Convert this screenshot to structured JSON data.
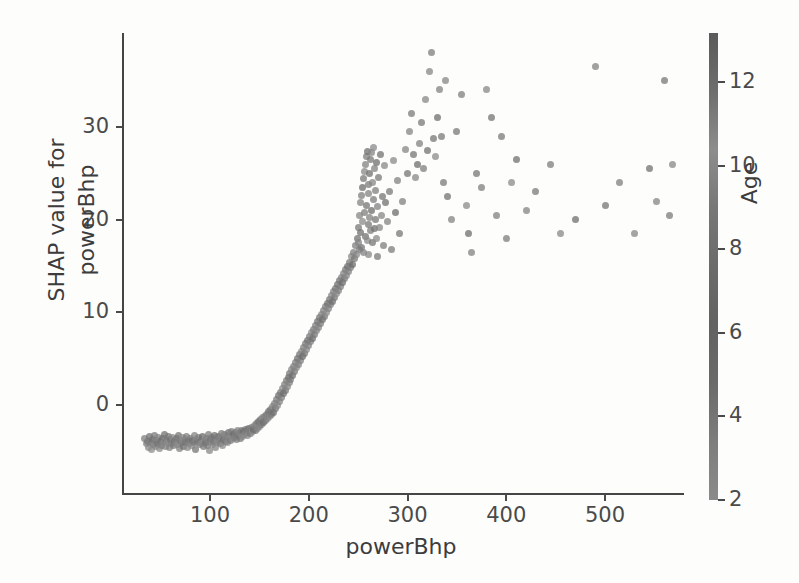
{
  "figure": {
    "kind": "shap-dependence-plot",
    "background": "#fdfdfc",
    "axis_color": "#454545",
    "text_color": "#3c3c3c"
  },
  "axes": {
    "xlabel": "powerBhp",
    "ylabel_line1": "SHAP value for",
    "ylabel_line2": "powerBhp",
    "xticks": [
      "100",
      "200",
      "300",
      "400",
      "500"
    ],
    "yticks": [
      "0",
      "10",
      "20",
      "30"
    ]
  },
  "colorbar": {
    "label": "Age",
    "ticks": [
      "2",
      "4",
      "6",
      "8",
      "10",
      "12"
    ],
    "low_color": "#8a8a8a",
    "high_color": "#5a5a5a"
  },
  "chart_data": {
    "type": "scatter",
    "title": "",
    "xlabel": "powerBhp",
    "ylabel": "SHAP value for powerBhp",
    "color_label": "Age",
    "xlim": [
      20,
      580
    ],
    "ylim": [
      -6,
      39
    ],
    "clim": [
      2,
      13
    ],
    "xticks": [
      100,
      200,
      300,
      400,
      500
    ],
    "yticks": [
      0,
      10,
      20,
      30
    ],
    "cticks": [
      2,
      4,
      6,
      8,
      10,
      12
    ],
    "grid": false,
    "legend": "colorbar-right",
    "marker_size_px": 7,
    "marker_opacity": 0.75,
    "colormap": "grayscale",
    "points": [
      [
        34,
        -3.6,
        6.2
      ],
      [
        36,
        -4.2,
        5.1
      ],
      [
        37,
        -3.9,
        7.4
      ],
      [
        38,
        -4.6,
        4.3
      ],
      [
        39,
        -3.4,
        8.8
      ],
      [
        40,
        -4.1,
        6.0
      ],
      [
        41,
        -4.8,
        3.6
      ],
      [
        42,
        -3.7,
        9.2
      ],
      [
        43,
        -4.3,
        5.5
      ],
      [
        44,
        -3.3,
        7.1
      ],
      [
        45,
        -4.5,
        4.8
      ],
      [
        46,
        -3.8,
        6.6
      ],
      [
        47,
        -4.2,
        8.1
      ],
      [
        48,
        -3.5,
        5.2
      ],
      [
        49,
        -4.7,
        3.9
      ],
      [
        50,
        -3.9,
        7.8
      ],
      [
        51,
        -4.4,
        6.3
      ],
      [
        52,
        -3.6,
        9.0
      ],
      [
        53,
        -4.0,
        4.6
      ],
      [
        54,
        -3.2,
        8.3
      ],
      [
        55,
        -4.5,
        5.7
      ],
      [
        56,
        -3.8,
        6.9
      ],
      [
        57,
        -4.1,
        4.1
      ],
      [
        58,
        -3.4,
        7.6
      ],
      [
        59,
        -4.6,
        5.9
      ],
      [
        60,
        -3.7,
        8.5
      ],
      [
        61,
        -4.2,
        6.1
      ],
      [
        62,
        -3.5,
        4.4
      ],
      [
        63,
        -4.4,
        7.2
      ],
      [
        64,
        -3.9,
        9.4
      ],
      [
        65,
        -4.0,
        5.3
      ],
      [
        66,
        -3.6,
        6.8
      ],
      [
        67,
        -4.3,
        4.0
      ],
      [
        68,
        -3.3,
        8.0
      ],
      [
        69,
        -4.7,
        5.6
      ],
      [
        70,
        -3.8,
        7.3
      ],
      [
        71,
        -4.1,
        6.5
      ],
      [
        72,
        -3.5,
        3.8
      ],
      [
        73,
        -4.5,
        9.1
      ],
      [
        74,
        -3.7,
        5.0
      ],
      [
        75,
        -4.0,
        7.7
      ],
      [
        76,
        -3.4,
        6.2
      ],
      [
        77,
        -4.6,
        4.5
      ],
      [
        78,
        -3.9,
        8.6
      ],
      [
        79,
        -4.2,
        5.8
      ],
      [
        80,
        -3.6,
        7.0
      ],
      [
        81,
        -4.4,
        3.5
      ],
      [
        82,
        -3.8,
        9.3
      ],
      [
        83,
        -4.1,
        6.4
      ],
      [
        84,
        -3.3,
        5.4
      ],
      [
        85,
        -4.8,
        7.9
      ],
      [
        86,
        -3.7,
        4.9
      ],
      [
        87,
        -4.0,
        8.2
      ],
      [
        88,
        -3.5,
        6.0
      ],
      [
        89,
        -4.3,
        5.1
      ],
      [
        90,
        -3.9,
        7.5
      ],
      [
        91,
        -4.2,
        3.7
      ],
      [
        92,
        -3.4,
        9.6
      ],
      [
        93,
        -4.5,
        6.7
      ],
      [
        94,
        -3.8,
        4.2
      ],
      [
        95,
        -4.0,
        8.4
      ],
      [
        96,
        -3.6,
        5.5
      ],
      [
        97,
        -4.4,
        7.1
      ],
      [
        98,
        -3.2,
        6.3
      ],
      [
        99,
        -4.9,
        4.7
      ],
      [
        100,
        -3.7,
        8.9
      ],
      [
        101,
        -4.1,
        5.9
      ],
      [
        102,
        -3.5,
        6.6
      ],
      [
        103,
        -4.3,
        3.4
      ],
      [
        104,
        -3.9,
        7.4
      ],
      [
        105,
        -3.3,
        9.0
      ],
      [
        106,
        -4.6,
        5.2
      ],
      [
        107,
        -3.8,
        6.1
      ],
      [
        108,
        -4.0,
        4.4
      ],
      [
        109,
        -3.4,
        8.7
      ],
      [
        110,
        -3.6,
        5.8
      ],
      [
        111,
        -4.2,
        7.2
      ],
      [
        112,
        -3.1,
        6.5
      ],
      [
        113,
        -4.4,
        4.0
      ],
      [
        114,
        -3.7,
        9.2
      ],
      [
        115,
        -3.2,
        5.6
      ],
      [
        116,
        -3.9,
        7.8
      ],
      [
        117,
        -3.5,
        6.0
      ],
      [
        118,
        -4.1,
        4.6
      ],
      [
        119,
        -3.0,
        8.3
      ],
      [
        120,
        -3.4,
        5.3
      ],
      [
        121,
        -3.8,
        7.0
      ],
      [
        122,
        -2.9,
        6.8
      ],
      [
        123,
        -3.6,
        4.3
      ],
      [
        124,
        -3.2,
        9.5
      ],
      [
        125,
        -3.5,
        5.7
      ],
      [
        126,
        -3.0,
        7.6
      ],
      [
        127,
        -3.7,
        6.2
      ],
      [
        128,
        -2.8,
        4.8
      ],
      [
        129,
        -3.3,
        8.1
      ],
      [
        130,
        -3.1,
        5.4
      ],
      [
        131,
        -3.6,
        7.3
      ],
      [
        132,
        -2.7,
        6.9
      ],
      [
        133,
        -3.4,
        4.1
      ],
      [
        134,
        -2.9,
        9.1
      ],
      [
        135,
        -3.2,
        5.0
      ],
      [
        136,
        -2.6,
        7.9
      ],
      [
        137,
        -3.0,
        6.4
      ],
      [
        138,
        -3.3,
        4.5
      ],
      [
        139,
        -2.5,
        8.8
      ],
      [
        140,
        -2.8,
        5.9
      ],
      [
        141,
        -3.1,
        7.1
      ],
      [
        142,
        -2.4,
        6.6
      ],
      [
        143,
        -2.9,
        3.9
      ],
      [
        144,
        -2.6,
        9.4
      ],
      [
        145,
        -2.2,
        5.5
      ],
      [
        146,
        -2.7,
        7.7
      ],
      [
        147,
        -2.0,
        6.1
      ],
      [
        148,
        -2.5,
        4.7
      ],
      [
        149,
        -1.8,
        8.5
      ],
      [
        150,
        -2.3,
        5.8
      ],
      [
        151,
        -1.6,
        7.4
      ],
      [
        152,
        -2.1,
        6.7
      ],
      [
        153,
        -1.4,
        4.2
      ],
      [
        154,
        -1.9,
        9.3
      ],
      [
        155,
        -1.2,
        5.6
      ],
      [
        156,
        -1.7,
        7.2
      ],
      [
        157,
        -1.0,
        6.3
      ],
      [
        158,
        -1.5,
        4.9
      ],
      [
        159,
        -0.7,
        8.6
      ],
      [
        160,
        -1.2,
        5.1
      ],
      [
        161,
        -0.5,
        7.5
      ],
      [
        162,
        -1.0,
        6.8
      ],
      [
        163,
        -0.2,
        4.4
      ],
      [
        164,
        -0.8,
        9.0
      ],
      [
        165,
        0.2,
        5.7
      ],
      [
        166,
        -0.4,
        7.8
      ],
      [
        167,
        0.6,
        6.2
      ],
      [
        168,
        0.0,
        4.6
      ],
      [
        169,
        1.0,
        8.2
      ],
      [
        170,
        0.4,
        5.3
      ],
      [
        171,
        1.4,
        7.0
      ],
      [
        172,
        0.8,
        6.5
      ],
      [
        173,
        1.8,
        4.0
      ],
      [
        174,
        1.2,
        9.2
      ],
      [
        175,
        2.2,
        5.9
      ],
      [
        176,
        1.6,
        7.6
      ],
      [
        177,
        2.6,
        6.0
      ],
      [
        178,
        2.0,
        4.8
      ],
      [
        179,
        3.0,
        8.4
      ],
      [
        180,
        2.4,
        5.2
      ],
      [
        181,
        3.4,
        7.3
      ],
      [
        182,
        2.8,
        6.6
      ],
      [
        183,
        3.8,
        4.3
      ],
      [
        184,
        3.2,
        9.1
      ],
      [
        185,
        4.2,
        5.8
      ],
      [
        186,
        3.6,
        7.1
      ],
      [
        187,
        4.6,
        6.4
      ],
      [
        188,
        4.0,
        4.5
      ],
      [
        189,
        5.0,
        8.7
      ],
      [
        190,
        4.4,
        5.5
      ],
      [
        191,
        5.4,
        7.4
      ],
      [
        192,
        4.8,
        6.1
      ],
      [
        193,
        5.8,
        4.1
      ],
      [
        194,
        5.2,
        9.4
      ],
      [
        195,
        6.2,
        5.6
      ],
      [
        196,
        5.6,
        7.9
      ],
      [
        197,
        6.6,
        6.7
      ],
      [
        198,
        6.0,
        4.7
      ],
      [
        199,
        7.0,
        8.3
      ],
      [
        200,
        6.4,
        5.4
      ],
      [
        201,
        7.4,
        7.2
      ],
      [
        202,
        6.8,
        6.3
      ],
      [
        203,
        7.8,
        4.2
      ],
      [
        204,
        7.2,
        8.9
      ],
      [
        205,
        8.2,
        5.7
      ],
      [
        206,
        7.6,
        7.5
      ],
      [
        207,
        8.6,
        6.0
      ],
      [
        208,
        8.0,
        4.9
      ],
      [
        209,
        9.0,
        8.1
      ],
      [
        210,
        8.4,
        5.0
      ],
      [
        211,
        9.4,
        7.7
      ],
      [
        212,
        8.8,
        6.8
      ],
      [
        213,
        9.8,
        4.4
      ],
      [
        214,
        9.2,
        9.3
      ],
      [
        215,
        10.2,
        5.9
      ],
      [
        216,
        9.6,
        7.0
      ],
      [
        217,
        10.6,
        6.5
      ],
      [
        218,
        10.0,
        4.0
      ],
      [
        219,
        11.0,
        8.6
      ],
      [
        220,
        10.4,
        5.3
      ],
      [
        221,
        11.4,
        7.8
      ],
      [
        222,
        10.8,
        6.2
      ],
      [
        223,
        11.8,
        4.6
      ],
      [
        224,
        11.2,
        9.0
      ],
      [
        225,
        12.2,
        5.8
      ],
      [
        226,
        11.6,
        7.3
      ],
      [
        227,
        12.6,
        6.9
      ],
      [
        228,
        12.0,
        4.1
      ],
      [
        229,
        13.0,
        8.5
      ],
      [
        230,
        12.4,
        5.5
      ],
      [
        231,
        13.4,
        7.6
      ],
      [
        232,
        12.8,
        6.4
      ],
      [
        233,
        13.8,
        4.8
      ],
      [
        234,
        13.2,
        9.5
      ],
      [
        235,
        14.2,
        5.1
      ],
      [
        236,
        13.6,
        7.1
      ],
      [
        237,
        14.6,
        6.6
      ],
      [
        238,
        14.0,
        4.3
      ],
      [
        239,
        15.0,
        8.8
      ],
      [
        240,
        14.4,
        5.6
      ],
      [
        241,
        15.4,
        7.4
      ],
      [
        242,
        14.8,
        6.0
      ],
      [
        243,
        16.0,
        4.5
      ],
      [
        244,
        15.2,
        9.2
      ],
      [
        245,
        16.5,
        5.9
      ],
      [
        246,
        15.8,
        7.9
      ],
      [
        247,
        17.2,
        6.3
      ],
      [
        248,
        16.2,
        4.7
      ],
      [
        249,
        18.0,
        8.0
      ],
      [
        250,
        17.5,
        5.2
      ],
      [
        250,
        19.2,
        7.2
      ],
      [
        251,
        16.8,
        6.7
      ],
      [
        251,
        20.5,
        4.9
      ],
      [
        252,
        18.6,
        8.7
      ],
      [
        252,
        21.8,
        5.4
      ],
      [
        253,
        17.0,
        7.5
      ],
      [
        253,
        22.6,
        6.1
      ],
      [
        254,
        19.8,
        4.2
      ],
      [
        254,
        23.5,
        9.1
      ],
      [
        255,
        16.5,
        5.7
      ],
      [
        255,
        24.4,
        7.0
      ],
      [
        256,
        20.8,
        6.5
      ],
      [
        256,
        25.2,
        4.4
      ],
      [
        257,
        18.2,
        8.3
      ],
      [
        257,
        26.0,
        5.8
      ],
      [
        258,
        21.5,
        7.7
      ],
      [
        258,
        26.8,
        6.2
      ],
      [
        259,
        17.8,
        4.0
      ],
      [
        259,
        27.4,
        8.9
      ],
      [
        260,
        22.8,
        5.3
      ],
      [
        260,
        19.5,
        7.3
      ],
      [
        261,
        23.8,
        6.8
      ],
      [
        261,
        16.2,
        4.6
      ],
      [
        262,
        25.0,
        8.4
      ],
      [
        262,
        20.2,
        5.5
      ],
      [
        263,
        26.5,
        7.1
      ],
      [
        263,
        18.8,
        6.4
      ],
      [
        264,
        27.2,
        4.8
      ],
      [
        264,
        21.0,
        9.3
      ],
      [
        265,
        24.0,
        5.0
      ],
      [
        265,
        17.5,
        7.8
      ],
      [
        266,
        22.2,
        6.6
      ],
      [
        266,
        27.8,
        4.1
      ],
      [
        267,
        19.0,
        8.6
      ],
      [
        267,
        25.5,
        5.6
      ],
      [
        268,
        20.0,
        7.4
      ],
      [
        268,
        23.2,
        6.0
      ],
      [
        269,
        18.0,
        4.3
      ],
      [
        269,
        26.2,
        9.0
      ],
      [
        270,
        21.4,
        5.9
      ],
      [
        270,
        16.0,
        7.2
      ],
      [
        271,
        24.6,
        6.9
      ],
      [
        272,
        19.2,
        4.7
      ],
      [
        273,
        27.0,
        8.2
      ],
      [
        274,
        20.5,
        5.1
      ],
      [
        275,
        22.5,
        7.6
      ],
      [
        276,
        17.2,
        6.3
      ],
      [
        277,
        25.8,
        4.5
      ],
      [
        278,
        21.8,
        8.8
      ],
      [
        280,
        19.8,
        5.4
      ],
      [
        282,
        23.0,
        7.0
      ],
      [
        284,
        16.8,
        6.7
      ],
      [
        286,
        26.4,
        4.2
      ],
      [
        288,
        20.8,
        9.4
      ],
      [
        290,
        24.2,
        5.7
      ],
      [
        292,
        18.5,
        7.5
      ],
      [
        295,
        22.0,
        6.1
      ],
      [
        298,
        27.6,
        4.9
      ],
      [
        300,
        25.0,
        8.1
      ],
      [
        302,
        29.5,
        5.2
      ],
      [
        304,
        31.5,
        6.8
      ],
      [
        306,
        27.0,
        7.9
      ],
      [
        308,
        24.5,
        4.4
      ],
      [
        310,
        26.0,
        9.2
      ],
      [
        312,
        28.2,
        5.8
      ],
      [
        314,
        30.5,
        7.3
      ],
      [
        316,
        25.5,
        6.2
      ],
      [
        318,
        33.0,
        4.6
      ],
      [
        320,
        27.5,
        8.5
      ],
      [
        322,
        36.0,
        5.0
      ],
      [
        324,
        38.0,
        6.5
      ],
      [
        326,
        28.8,
        7.7
      ],
      [
        328,
        26.8,
        4.0
      ],
      [
        330,
        31.0,
        8.9
      ],
      [
        332,
        34.0,
        5.5
      ],
      [
        334,
        29.0,
        7.1
      ],
      [
        336,
        24.0,
        6.9
      ],
      [
        338,
        35.0,
        4.8
      ],
      [
        340,
        22.5,
        8.3
      ],
      [
        345,
        20.0,
        5.3
      ],
      [
        350,
        29.5,
        7.4
      ],
      [
        355,
        33.5,
        6.0
      ],
      [
        360,
        21.5,
        4.3
      ],
      [
        362,
        18.5,
        9.1
      ],
      [
        365,
        16.5,
        5.6
      ],
      [
        370,
        25.0,
        7.8
      ],
      [
        375,
        23.5,
        6.4
      ],
      [
        380,
        34.0,
        4.7
      ],
      [
        385,
        31.0,
        8.0
      ],
      [
        390,
        20.5,
        5.9
      ],
      [
        395,
        29.0,
        7.2
      ],
      [
        400,
        18.0,
        6.6
      ],
      [
        405,
        24.0,
        4.1
      ],
      [
        410,
        26.5,
        8.7
      ],
      [
        420,
        21.0,
        5.4
      ],
      [
        430,
        23.0,
        7.0
      ],
      [
        445,
        26.0,
        6.3
      ],
      [
        455,
        18.5,
        4.5
      ],
      [
        470,
        20.0,
        9.0
      ],
      [
        490,
        36.5,
        5.8
      ],
      [
        500,
        21.5,
        7.6
      ],
      [
        515,
        24.0,
        6.1
      ],
      [
        530,
        18.5,
        4.9
      ],
      [
        545,
        25.5,
        8.4
      ],
      [
        552,
        22.0,
        5.2
      ],
      [
        560,
        35.0,
        7.5
      ],
      [
        565,
        20.5,
        6.8
      ],
      [
        568,
        26.0,
        4.6
      ]
    ]
  }
}
